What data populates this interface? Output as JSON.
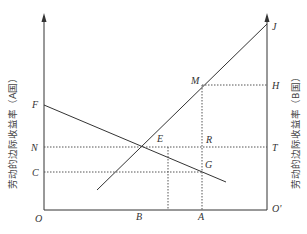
{
  "axes": {
    "left_title": "劳动的边际收益率（A国）",
    "right_title": "劳动的边际收益率（B国）",
    "origin_left": "O",
    "origin_right": "O'"
  },
  "points": {
    "F": "F",
    "N": "N",
    "C": "C",
    "E": "E",
    "M": "M",
    "R": "R",
    "G": "G",
    "H": "H",
    "T": "T",
    "J": "J",
    "B": "B",
    "A": "A"
  },
  "colors": {
    "line": "#333333",
    "dotted": "#555555",
    "background": "#ffffff"
  }
}
